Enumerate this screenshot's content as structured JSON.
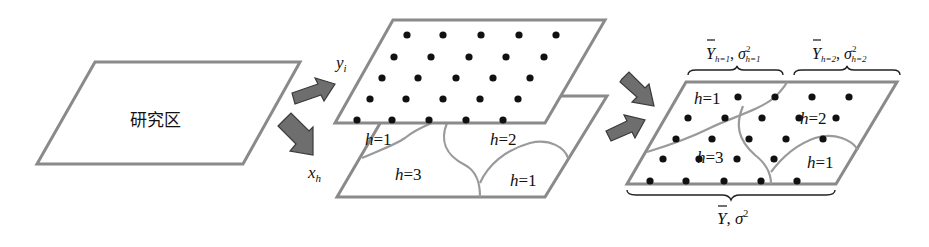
{
  "diagram": {
    "study_area": {
      "label": "研究区"
    },
    "sample_layer": {
      "variable_label": "y",
      "variable_subscript": "i"
    },
    "strata_layer": {
      "variable_label": "x",
      "variable_subscript": "h",
      "strata": [
        {
          "h": "h",
          "eq": "=1"
        },
        {
          "h": "h",
          "eq": "=2"
        },
        {
          "h": "h",
          "eq": "=3"
        },
        {
          "h": "h",
          "eq": "=1"
        }
      ]
    },
    "combined_layer": {
      "strata": [
        {
          "h": "h",
          "eq": "=1"
        },
        {
          "h": "h",
          "eq": "=2"
        },
        {
          "h": "h",
          "eq": "=3"
        },
        {
          "h": "h",
          "eq": "=1"
        }
      ],
      "top_brace_left": {
        "mean": "Y",
        "mean_sub": "h=1",
        "var": "σ",
        "var_sup": "2",
        "var_sub": "h=1"
      },
      "top_brace_right": {
        "mean": "Y",
        "mean_sub": "h=2",
        "var": "σ",
        "var_sup": "2",
        "var_sub": "h=2"
      },
      "bottom_brace": {
        "mean": "Y",
        "sep": ",",
        "var": "σ",
        "var_sup": "2"
      }
    },
    "colors": {
      "outline": "#8a8a8a",
      "arrow_fill": "#6e6e6e",
      "dot": "#111111",
      "text": "#111111"
    }
  }
}
